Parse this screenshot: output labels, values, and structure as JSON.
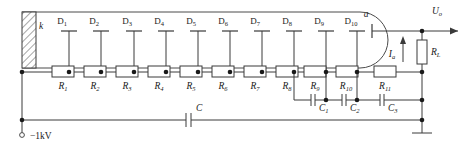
{
  "diagram": {
    "supply_label": "−1kV",
    "cathode_label": "k",
    "anode_label": "a",
    "output_label": "U",
    "output_sub": "o",
    "anode_current_label": "I",
    "anode_current_sub": "a",
    "load_label": "R",
    "load_sub": "L",
    "coupling_cap_label": "C",
    "dynodes": [
      {
        "label": "D",
        "sub": "1"
      },
      {
        "label": "D",
        "sub": "2"
      },
      {
        "label": "D",
        "sub": "3"
      },
      {
        "label": "D",
        "sub": "4"
      },
      {
        "label": "D",
        "sub": "5"
      },
      {
        "label": "D",
        "sub": "6"
      },
      {
        "label": "D",
        "sub": "7"
      },
      {
        "label": "D",
        "sub": "8"
      },
      {
        "label": "D",
        "sub": "9"
      },
      {
        "label": "D",
        "sub": "10"
      }
    ],
    "resistors": [
      {
        "label": "R",
        "sub": "1"
      },
      {
        "label": "R",
        "sub": "2"
      },
      {
        "label": "R",
        "sub": "3"
      },
      {
        "label": "R",
        "sub": "4"
      },
      {
        "label": "R",
        "sub": "5"
      },
      {
        "label": "R",
        "sub": "6"
      },
      {
        "label": "R",
        "sub": "7"
      },
      {
        "label": "R",
        "sub": "8"
      },
      {
        "label": "R",
        "sub": "9"
      },
      {
        "label": "R",
        "sub": "10"
      },
      {
        "label": "R",
        "sub": "11"
      }
    ],
    "capacitors": [
      {
        "label": "C",
        "sub": "1"
      },
      {
        "label": "C",
        "sub": "2"
      },
      {
        "label": "C",
        "sub": "3"
      }
    ],
    "colors": {
      "line": "#3a3a3a",
      "node": "#1a1a1a",
      "background": "#ffffff",
      "text": "#1a1a1a"
    }
  }
}
